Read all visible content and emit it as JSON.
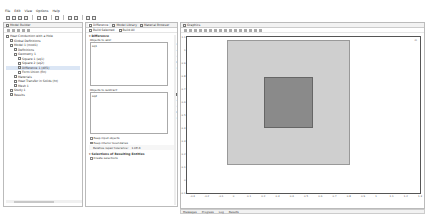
{
  "menu": [
    "File",
    "Edit",
    "View",
    "Options",
    "Help"
  ],
  "model_builder": {
    "title": "Model Builder",
    "tree": [
      {
        "label": "Heat Conduction with a Hole",
        "indent": 0,
        "icon": "model-root-icon"
      },
      {
        "label": "Global Definitions",
        "indent": 1,
        "icon": "global-definitions-icon"
      },
      {
        "label": "Model 1 (mod1)",
        "indent": 1,
        "icon": "model-icon"
      },
      {
        "label": "Definitions",
        "indent": 2,
        "icon": "definitions-icon"
      },
      {
        "label": "Geometry 1",
        "indent": 2,
        "icon": "geometry-icon"
      },
      {
        "label": "Square 1 (sq1)",
        "indent": 3,
        "icon": "square-icon"
      },
      {
        "label": "Square 2 (sq2)",
        "indent": 3,
        "icon": "square-icon"
      },
      {
        "label": "Difference 1 (dif1)",
        "indent": 3,
        "icon": "difference-icon",
        "selected": true
      },
      {
        "label": "Form Union (fin)",
        "indent": 3,
        "icon": "form-union-icon"
      },
      {
        "label": "Materials",
        "indent": 2,
        "icon": "materials-icon"
      },
      {
        "label": "Heat Transfer in Solids (ht)",
        "indent": 2,
        "icon": "heat-transfer-icon"
      },
      {
        "label": "Mesh 1",
        "indent": 2,
        "icon": "mesh-icon"
      },
      {
        "label": "Study 1",
        "indent": 1,
        "icon": "study-icon"
      },
      {
        "label": "Results",
        "indent": 1,
        "icon": "results-icon"
      }
    ]
  },
  "settings": {
    "tabs": [
      "Difference",
      "Model Library",
      "Material Browser"
    ],
    "build_selected": "Build Selected",
    "build_all": "Build All",
    "section_title": "Difference",
    "objects_to_add_label": "Objects to add:",
    "objects_to_add": [
      "sq1"
    ],
    "objects_to_subtract_label": "Objects to subtract:",
    "objects_to_subtract": [
      "sq2"
    ],
    "keep_input_objects": {
      "label": "Keep input objects",
      "checked": false
    },
    "keep_interior_boundaries": {
      "label": "Keep interior boundaries",
      "checked": true
    },
    "repair_tolerance_label": "Relative repair tolerance:",
    "repair_tolerance_value": "1.0E-6",
    "resulting_section_title": "Selections of Resulting Entities",
    "create_selections": {
      "label": "Create selections",
      "checked": false
    }
  },
  "graphics": {
    "title": "Graphics",
    "x_ticks": [
      "-0.3",
      "-0.2",
      "-0.1",
      "0",
      "0.1",
      "0.2",
      "0.3",
      "0.4",
      "0.5",
      "0.6",
      "0.7",
      "0.8",
      "0.9",
      "1",
      "1.1",
      "1.2",
      "1.3"
    ],
    "y_ticks": [
      "1.1",
      "1",
      "0.9",
      "0.8",
      "0.7",
      "0.6",
      "0.5",
      "0.4",
      "0.3",
      "0.2",
      "0.1",
      "0",
      "-0.1"
    ],
    "axes_label": "m"
  },
  "bottom_tabs": [
    "Messages",
    "Progress",
    "Log",
    "Results"
  ]
}
